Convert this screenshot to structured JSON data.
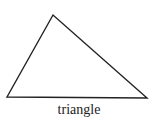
{
  "figure": {
    "shape": "triangle",
    "caption": "triangle",
    "stroke_color": "#222222",
    "background": "#ffffff",
    "vertices": [
      [
        53,
        15
      ],
      [
        7,
        97
      ],
      [
        147,
        98
      ]
    ]
  }
}
